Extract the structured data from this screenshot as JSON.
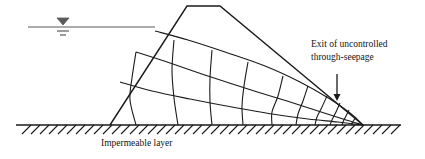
{
  "figure": {
    "kind": "earth-dam-seepage-flow-net-cross-section",
    "annotations": {
      "exit_label_line1": "Exit of uncontrolled",
      "exit_label_line2": "through-seepage",
      "impermeable_layer_label": "Impermeable layer"
    },
    "icons": {
      "water_table": "water-table-icon",
      "arrow": "annotation-arrow-icon",
      "hatching": "hatching-icon"
    },
    "colors": {
      "line": "#1a1a1a",
      "flownet": "#1a1a1a",
      "water": "#555555",
      "background": "#ffffff"
    }
  },
  "chart_data": {
    "type": "diagram",
    "title": "",
    "xlabel": "",
    "ylabel": "",
    "geometry": {
      "embankment_outline": [
        [
          110,
          125
        ],
        [
          187,
          6
        ],
        [
          220,
          6
        ],
        [
          363,
          125
        ]
      ],
      "crest_left_x": 187,
      "crest_right_x": 220,
      "crest_y": 6,
      "upstream_toe": [
        110,
        125
      ],
      "downstream_toe": [
        363,
        125
      ],
      "base_line_y": 125,
      "base_line_x_start": 16,
      "base_line_x_end": 401,
      "reservoir_water_line": [
        [
          28,
          27
        ],
        [
          155,
          27
        ]
      ],
      "water_table_symbol": {
        "cx": 63,
        "top_y": 18,
        "half_w": 6,
        "tri_h": 7,
        "tick1_y": 31,
        "tick1_half_w": 6,
        "tick2_y": 35,
        "tick2_half_w": 3
      },
      "phreatic_entry": [
        155,
        31
      ],
      "phreatic_exit": [
        363,
        125
      ],
      "hatch_x_start": 22,
      "hatch_x_end": 398,
      "hatch_spacing": 9,
      "hatch_len": 9
    },
    "flow_lines": [
      [
        [
          155,
          31
        ],
        [
          188,
          40
        ],
        [
          225,
          52
        ],
        [
          265,
          66
        ],
        [
          300,
          82
        ],
        [
          330,
          99
        ],
        [
          350,
          113
        ],
        [
          363,
          125
        ]
      ],
      [
        [
          136,
          52
        ],
        [
          170,
          63
        ],
        [
          208,
          76
        ],
        [
          248,
          89
        ],
        [
          287,
          101
        ],
        [
          318,
          111
        ],
        [
          343,
          119
        ],
        [
          363,
          125
        ]
      ],
      [
        [
          120,
          82
        ],
        [
          152,
          91
        ],
        [
          190,
          99
        ],
        [
          232,
          107
        ],
        [
          272,
          114
        ],
        [
          308,
          119
        ],
        [
          338,
          122
        ],
        [
          363,
          125
        ]
      ]
    ],
    "equipotential_lines": [
      [
        [
          136,
          52
        ],
        [
          132,
          78
        ],
        [
          130,
          100
        ],
        [
          136,
          125
        ]
      ],
      [
        [
          174,
          40
        ],
        [
          172,
          70
        ],
        [
          174,
          98
        ],
        [
          178,
          125
        ]
      ],
      [
        [
          212,
          50
        ],
        [
          210,
          78
        ],
        [
          210,
          102
        ],
        [
          212,
          125
        ]
      ],
      [
        [
          248,
          62
        ],
        [
          244,
          86
        ],
        [
          242,
          106
        ],
        [
          243,
          125
        ]
      ],
      [
        [
          283,
          76
        ],
        [
          278,
          96
        ],
        [
          272,
          112
        ],
        [
          272,
          125
        ]
      ],
      [
        [
          308,
          86
        ],
        [
          303,
          101
        ],
        [
          298,
          114
        ],
        [
          296,
          125
        ]
      ],
      [
        [
          327,
          96
        ],
        [
          322,
          107
        ],
        [
          317,
          117
        ],
        [
          315,
          125
        ]
      ],
      [
        [
          340,
          103
        ],
        [
          336,
          112
        ],
        [
          332,
          120
        ],
        [
          330,
          125
        ]
      ],
      [
        [
          349,
          110
        ],
        [
          346,
          116
        ],
        [
          343,
          122
        ],
        [
          342,
          125
        ]
      ],
      [
        [
          356,
          117
        ],
        [
          354,
          120
        ],
        [
          352,
          123
        ],
        [
          352,
          125
        ]
      ]
    ],
    "annotation_arrow": {
      "x": 337,
      "y_start": 74,
      "y_end": 101,
      "head_w": 3.5,
      "head_h": 7
    },
    "labels": [
      {
        "text": "Exit of uncontrolled",
        "x": 311,
        "y": 47
      },
      {
        "text": "through-seepage",
        "x": 311,
        "y": 60
      },
      {
        "text": "Impermeable layer",
        "x": 101,
        "y": 146
      }
    ]
  }
}
